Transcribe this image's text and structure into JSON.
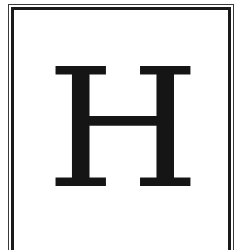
{
  "tile": {
    "letter": "H",
    "colors": {
      "letter": "#151515",
      "border": "#1a1a1a",
      "background": "#ffffff"
    }
  }
}
